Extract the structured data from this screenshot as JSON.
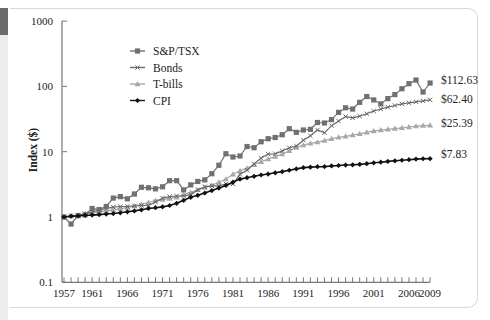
{
  "chart_data": {
    "type": "line",
    "title": "",
    "xlabel": "",
    "ylabel": "Index ($)",
    "yscale": "log",
    "ylim": [
      0.1,
      1000
    ],
    "y_ticks": [
      "1000",
      "100",
      "10",
      "1",
      "0.1"
    ],
    "x_tick_labels": [
      "1957",
      "1961",
      "1966",
      "1971",
      "1976",
      "1981",
      "1986",
      "1991",
      "1996",
      "2001",
      "2006",
      "2009"
    ],
    "x": [
      1957,
      1958,
      1959,
      1960,
      1961,
      1962,
      1963,
      1964,
      1965,
      1966,
      1967,
      1968,
      1969,
      1970,
      1971,
      1972,
      1973,
      1974,
      1975,
      1976,
      1977,
      1978,
      1979,
      1980,
      1981,
      1982,
      1983,
      1984,
      1985,
      1986,
      1987,
      1988,
      1989,
      1990,
      1991,
      1992,
      1993,
      1994,
      1995,
      1996,
      1997,
      1998,
      1999,
      2000,
      2001,
      2002,
      2003,
      2004,
      2005,
      2006,
      2007,
      2008,
      2009
    ],
    "legend_position": "upper-left",
    "grid": false,
    "series": [
      {
        "name": "S&P/TSX",
        "color": "#707070",
        "marker": "square",
        "end_label": "$112.63",
        "values": [
          1.0,
          0.78,
          1.05,
          1.08,
          1.35,
          1.3,
          1.45,
          1.95,
          2.05,
          1.9,
          2.25,
          2.85,
          2.8,
          2.7,
          2.9,
          3.6,
          3.6,
          2.6,
          3.1,
          3.5,
          3.7,
          4.6,
          6.2,
          9.3,
          8.3,
          8.6,
          12.0,
          11.5,
          14.2,
          15.8,
          16.5,
          18.2,
          22.5,
          19.8,
          21.5,
          22.0,
          28.0,
          27.5,
          31.0,
          40.0,
          47.0,
          45.0,
          57.0,
          70.0,
          62.0,
          54.0,
          65.0,
          75.0,
          92.0,
          110.0,
          125.0,
          82.0,
          112.63
        ]
      },
      {
        "name": "Bonds",
        "color": "#6a6a6a",
        "marker": "x",
        "end_label": "$62.40",
        "values": [
          1.0,
          1.05,
          1.05,
          1.12,
          1.2,
          1.28,
          1.35,
          1.42,
          1.45,
          1.45,
          1.48,
          1.5,
          1.5,
          1.7,
          1.95,
          2.05,
          2.1,
          2.1,
          2.2,
          2.6,
          2.9,
          3.0,
          3.0,
          3.2,
          3.2,
          4.5,
          5.2,
          6.5,
          8.0,
          9.2,
          9.3,
          10.3,
          11.5,
          12.2,
          15.0,
          17.5,
          21.5,
          19.5,
          25.0,
          29.5,
          34.5,
          33.0,
          35.0,
          38.0,
          42.0,
          45.0,
          48.0,
          51.0,
          54.0,
          56.0,
          58.0,
          60.0,
          62.4
        ]
      },
      {
        "name": "T-bills",
        "color": "#a8a8a8",
        "marker": "triangle",
        "end_label": "$25.39",
        "values": [
          1.0,
          1.03,
          1.07,
          1.12,
          1.15,
          1.2,
          1.24,
          1.29,
          1.34,
          1.4,
          1.47,
          1.56,
          1.67,
          1.79,
          1.85,
          1.92,
          2.01,
          2.2,
          2.38,
          2.6,
          2.82,
          3.06,
          3.4,
          3.8,
          4.5,
          5.1,
          5.6,
          6.3,
          7.0,
          7.7,
          8.4,
          9.2,
          10.3,
          11.6,
          12.6,
          13.4,
          14.0,
          14.8,
          15.8,
          16.6,
          17.2,
          18.0,
          18.8,
          19.8,
          20.8,
          21.4,
          22.0,
          22.6,
          23.2,
          23.9,
          24.6,
          25.1,
          25.39
        ]
      },
      {
        "name": "CPI",
        "color": "#111111",
        "marker": "diamond",
        "end_label": "$7.83",
        "values": [
          1.0,
          1.03,
          1.04,
          1.06,
          1.07,
          1.09,
          1.11,
          1.13,
          1.16,
          1.2,
          1.24,
          1.29,
          1.35,
          1.39,
          1.43,
          1.5,
          1.62,
          1.8,
          2.0,
          2.15,
          2.33,
          2.54,
          2.77,
          3.05,
          3.42,
          3.8,
          4.0,
          4.2,
          4.4,
          4.55,
          4.75,
          4.95,
          5.2,
          5.45,
          5.7,
          5.8,
          5.9,
          5.92,
          6.05,
          6.15,
          6.25,
          6.3,
          6.4,
          6.55,
          6.75,
          6.9,
          7.1,
          7.25,
          7.4,
          7.55,
          7.7,
          7.8,
          7.83
        ]
      }
    ]
  }
}
